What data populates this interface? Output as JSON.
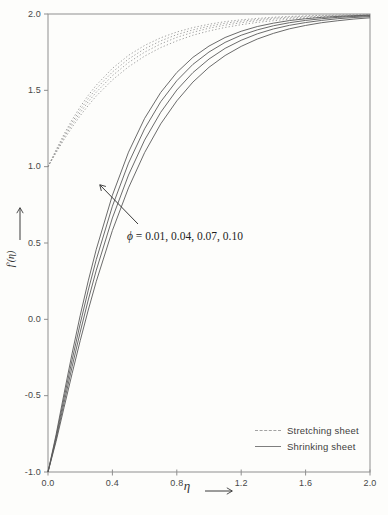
{
  "figure": {
    "type": "scientific-line-chart",
    "background": "#fdfdfb",
    "frame_color": "#8f8f8f",
    "curve_color_stretching": "#8a8a8a",
    "curve_color_shrinking": "#5a5a5a"
  },
  "axes": {
    "x": {
      "label": "η",
      "tick_labels": [
        "0.0",
        "0.4",
        "0.8",
        "1.2",
        "1.6",
        "2.0"
      ],
      "tick_values": [
        0,
        0.4,
        0.8,
        1.2,
        1.6,
        2.0
      ],
      "range": [
        0,
        2
      ]
    },
    "y": {
      "label": "f'(η)",
      "tick_labels": [
        "2.0",
        "1.5",
        "1.0",
        "0.5",
        "0.0",
        "-0.5",
        "-1.0"
      ],
      "tick_values": [
        2,
        1.5,
        1,
        0.5,
        0,
        -0.5,
        -1
      ],
      "range": [
        -1,
        2
      ]
    }
  },
  "annotation": {
    "text": " = 0.01, 0.04, 0.07, 0.10",
    "symbol": "ϕ"
  },
  "legend": {
    "items": [
      {
        "label": "Stretching sheet",
        "line_style": "dashed"
      },
      {
        "label": "Shrinking sheet",
        "line_style": "solid"
      }
    ]
  },
  "chart_data": {
    "type": "line",
    "title": "",
    "xlabel": "η",
    "ylabel": "f'(η)",
    "xlim": [
      0,
      2
    ],
    "ylim": [
      -1,
      2
    ],
    "grid": false,
    "legend_position": "lower right",
    "x": [
      0,
      0.05,
      0.1,
      0.15,
      0.2,
      0.25,
      0.3,
      0.4,
      0.5,
      0.6,
      0.7,
      0.8,
      0.9,
      1.0,
      1.1,
      1.2,
      1.3,
      1.4,
      1.5,
      1.6,
      1.7,
      1.8,
      1.9,
      2.0
    ],
    "series": [
      {
        "name": "Stretching sheet, phi=0.01",
        "group": "stretching",
        "phi": 0.01,
        "style": "dashed",
        "values": [
          1.0,
          1.091,
          1.178,
          1.259,
          1.334,
          1.401,
          1.463,
          1.568,
          1.654,
          1.724,
          1.78,
          1.824,
          1.861,
          1.889,
          1.912,
          1.93,
          1.945,
          1.956,
          1.966,
          1.973,
          1.979,
          1.983,
          1.987,
          1.99
        ]
      },
      {
        "name": "Stretching sheet, phi=0.04",
        "group": "stretching",
        "phi": 0.04,
        "style": "dashed",
        "values": [
          1.0,
          1.097,
          1.19,
          1.276,
          1.354,
          1.425,
          1.488,
          1.596,
          1.682,
          1.75,
          1.804,
          1.847,
          1.88,
          1.907,
          1.927,
          1.943,
          1.956,
          1.966,
          1.973,
          1.979,
          1.984,
          1.988,
          1.99,
          1.993
        ]
      },
      {
        "name": "Stretching sheet, phi=0.07",
        "group": "stretching",
        "phi": 0.07,
        "style": "dashed",
        "values": [
          1.0,
          1.104,
          1.202,
          1.292,
          1.373,
          1.446,
          1.511,
          1.62,
          1.705,
          1.772,
          1.824,
          1.865,
          1.896,
          1.92,
          1.939,
          1.953,
          1.964,
          1.973,
          1.979,
          1.984,
          1.988,
          1.991,
          1.993,
          1.995
        ]
      },
      {
        "name": "Stretching sheet, phi=0.10",
        "group": "stretching",
        "phi": 0.1,
        "style": "dashed",
        "values": [
          1.0,
          1.11,
          1.214,
          1.308,
          1.392,
          1.467,
          1.534,
          1.644,
          1.729,
          1.794,
          1.844,
          1.882,
          1.911,
          1.933,
          1.95,
          1.962,
          1.971,
          1.979,
          1.984,
          1.988,
          1.991,
          1.993,
          1.995,
          1.996
        ]
      },
      {
        "name": "Shrinking sheet, phi=0.01",
        "group": "shrinking",
        "phi": 0.01,
        "style": "solid",
        "values": [
          -1.0,
          -0.801,
          -0.576,
          -0.354,
          -0.14,
          0.061,
          0.249,
          0.582,
          0.861,
          1.092,
          1.28,
          1.431,
          1.554,
          1.651,
          1.728,
          1.788,
          1.836,
          1.873,
          1.903,
          1.925,
          1.943,
          1.956,
          1.967,
          1.975
        ]
      },
      {
        "name": "Shrinking sheet, phi=0.04",
        "group": "shrinking",
        "phi": 0.04,
        "style": "solid",
        "values": [
          -1.0,
          -0.786,
          -0.546,
          -0.309,
          -0.084,
          0.127,
          0.322,
          0.664,
          0.945,
          1.174,
          1.356,
          1.502,
          1.616,
          1.705,
          1.775,
          1.828,
          1.87,
          1.902,
          1.926,
          1.944,
          1.958,
          1.969,
          1.977,
          1.983
        ]
      },
      {
        "name": "Shrinking sheet, phi=0.07",
        "group": "shrinking",
        "phi": 0.07,
        "style": "solid",
        "values": [
          -1.0,
          -0.771,
          -0.515,
          -0.265,
          -0.029,
          0.191,
          0.392,
          0.741,
          1.023,
          1.248,
          1.425,
          1.563,
          1.67,
          1.751,
          1.814,
          1.861,
          1.896,
          1.923,
          1.943,
          1.958,
          1.969,
          1.978,
          1.984,
          1.988
        ]
      },
      {
        "name": "Shrinking sheet, phi=0.10",
        "group": "shrinking",
        "phi": 0.1,
        "style": "solid",
        "values": [
          -1.0,
          -0.756,
          -0.485,
          -0.222,
          0.025,
          0.252,
          0.459,
          0.813,
          1.095,
          1.316,
          1.486,
          1.617,
          1.716,
          1.79,
          1.846,
          1.887,
          1.918,
          1.94,
          1.957,
          1.969,
          1.978,
          1.984,
          1.989,
          1.992
        ]
      }
    ]
  }
}
